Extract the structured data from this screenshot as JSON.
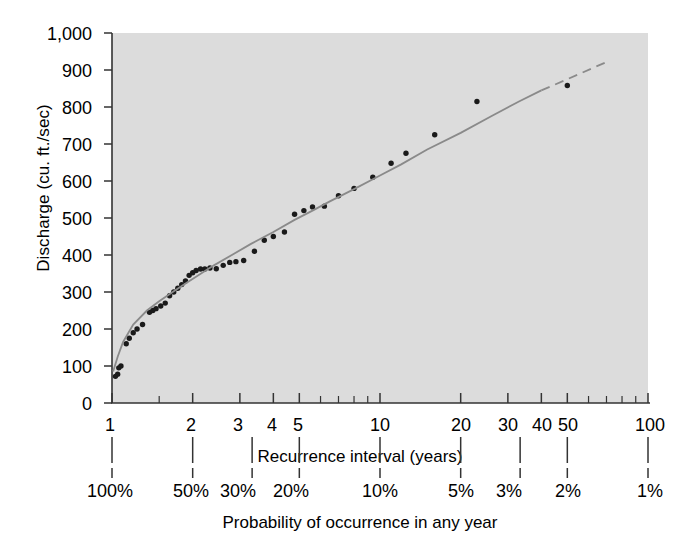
{
  "chart_data": {
    "type": "scatter",
    "title": "",
    "subtitle": "",
    "xlabel": "Recurrence interval (years)",
    "xlabel2": "Probability of occurrence in any year",
    "ylabel": "Discharge (cu. ft./sec)",
    "xscale": "log",
    "yscale": "linear",
    "xlim": [
      1,
      100
    ],
    "ylim": [
      0,
      1000
    ],
    "grid": false,
    "legend": null,
    "plot_background": "#dcdcdc",
    "point_color": "#1a1a1a",
    "fit_line_color": "#8a8a8a",
    "x_ticklabels": [
      "1",
      "2",
      "3",
      "4",
      "5",
      "10",
      "20",
      "30",
      "40",
      "50",
      "100"
    ],
    "x_tickvalues": [
      1,
      2,
      3,
      4,
      5,
      10,
      20,
      30,
      40,
      50,
      100
    ],
    "x_minor_tickvalues": [
      1.5,
      6,
      7,
      8,
      9,
      60,
      70,
      80,
      90
    ],
    "y_ticklabels": [
      "0",
      "100",
      "200",
      "300",
      "400",
      "500",
      "600",
      "700",
      "800",
      "900",
      "1,000"
    ],
    "y_tickvalues": [
      0,
      100,
      200,
      300,
      400,
      500,
      600,
      700,
      800,
      900,
      1000
    ],
    "probability_ticklabels": [
      "100%",
      "50%",
      "30%",
      "20%",
      "10%",
      "5%",
      "3%",
      "2%",
      "1%"
    ],
    "probability_tickvalues": [
      1,
      2,
      3.333,
      5,
      10,
      20,
      33.333,
      50,
      100
    ],
    "series": [
      {
        "name": "Annual peak discharge observations",
        "type": "scatter",
        "points": [
          [
            1.03,
            72
          ],
          [
            1.05,
            78
          ],
          [
            1.06,
            95
          ],
          [
            1.08,
            100
          ],
          [
            1.13,
            160
          ],
          [
            1.16,
            175
          ],
          [
            1.2,
            190
          ],
          [
            1.24,
            200
          ],
          [
            1.3,
            212
          ],
          [
            1.38,
            245
          ],
          [
            1.42,
            250
          ],
          [
            1.46,
            255
          ],
          [
            1.52,
            262
          ],
          [
            1.58,
            270
          ],
          [
            1.64,
            290
          ],
          [
            1.7,
            300
          ],
          [
            1.76,
            310
          ],
          [
            1.82,
            320
          ],
          [
            1.88,
            330
          ],
          [
            1.94,
            345
          ],
          [
            2.0,
            352
          ],
          [
            2.06,
            358
          ],
          [
            2.14,
            362
          ],
          [
            2.22,
            362
          ],
          [
            2.32,
            365
          ],
          [
            2.45,
            363
          ],
          [
            2.6,
            372
          ],
          [
            2.75,
            380
          ],
          [
            2.9,
            382
          ],
          [
            3.1,
            385
          ],
          [
            3.4,
            410
          ],
          [
            3.7,
            440
          ],
          [
            4.0,
            450
          ],
          [
            4.4,
            462
          ],
          [
            4.8,
            510
          ],
          [
            5.2,
            520
          ],
          [
            5.6,
            530
          ],
          [
            6.2,
            532
          ],
          [
            7.0,
            560
          ],
          [
            8.0,
            580
          ],
          [
            9.4,
            610
          ],
          [
            11.0,
            648
          ],
          [
            12.5,
            675
          ],
          [
            16.0,
            725
          ],
          [
            23.0,
            815
          ],
          [
            50.0,
            858
          ]
        ]
      },
      {
        "name": "Fitted frequency curve",
        "type": "line",
        "style": "solid",
        "points": [
          [
            1.01,
            85
          ],
          [
            1.05,
            125
          ],
          [
            1.1,
            165
          ],
          [
            1.2,
            212
          ],
          [
            1.35,
            250
          ],
          [
            1.5,
            275
          ],
          [
            1.7,
            302
          ],
          [
            1.9,
            325
          ],
          [
            2.1,
            345
          ],
          [
            2.4,
            372
          ],
          [
            2.8,
            400
          ],
          [
            3.3,
            430
          ],
          [
            4.0,
            462
          ],
          [
            4.8,
            495
          ],
          [
            5.6,
            520
          ],
          [
            6.5,
            545
          ],
          [
            8.0,
            578
          ],
          [
            10.0,
            615
          ],
          [
            12.0,
            645
          ],
          [
            15.0,
            685
          ],
          [
            20.0,
            730
          ],
          [
            26.0,
            775
          ],
          [
            33.0,
            815
          ],
          [
            40.0,
            845
          ]
        ]
      },
      {
        "name": "Extrapolated frequency curve",
        "type": "line",
        "style": "dashed",
        "points": [
          [
            40.0,
            845
          ],
          [
            50.0,
            875
          ],
          [
            62.0,
            905
          ],
          [
            72.0,
            925
          ]
        ]
      }
    ]
  }
}
